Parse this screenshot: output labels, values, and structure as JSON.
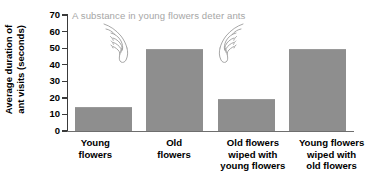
{
  "chart_data": {
    "type": "bar",
    "title": "",
    "xlabel": "",
    "ylabel": "Average duration of ant visits (seconds)",
    "ylabel_line1": "Average duration of",
    "ylabel_line2": "ant visits (seconds)",
    "ylim": [
      0,
      70
    ],
    "ytick_step": 10,
    "yticks": [
      0,
      10,
      20,
      30,
      40,
      50,
      60,
      70
    ],
    "ytick_labels": [
      "0",
      "10",
      "20",
      "30",
      "40",
      "50",
      "60",
      "70"
    ],
    "grid": false,
    "legend": false,
    "categories": [
      "Young\nflowers",
      "Old\nflowers",
      "Old flowers\nwiped with\nyoung flowers",
      "Young flowers\nwiped with\nold flowers"
    ],
    "values": [
      14,
      49,
      19,
      49
    ],
    "annotations": [
      {
        "text": "A substance in young flowers deter ants",
        "color": "#a6a6a6"
      }
    ],
    "bar_color": "#8e8e8e",
    "axis_color": "#3a3a3a",
    "background": "#ffffff"
  },
  "icons": {
    "hand_left": "pointing-hand-down-icon",
    "hand_right": "pointing-hand-down-icon"
  }
}
